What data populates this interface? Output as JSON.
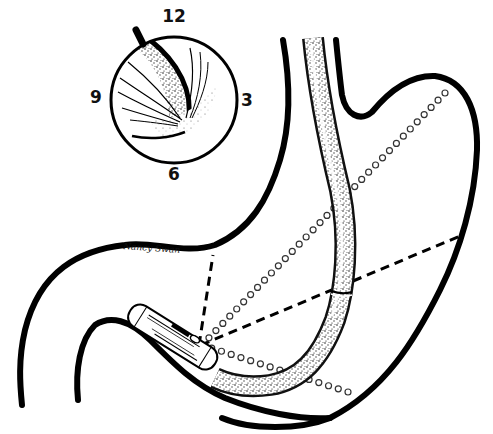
{
  "figure": {
    "inset": {
      "description": "Endoscopic view with clock-face orientation",
      "clock_labels": {
        "top": "12",
        "right": "3",
        "bottom": "6",
        "left": "9"
      }
    },
    "signature": "Nancy Swan",
    "colors": {
      "ink": "#000000",
      "background": "#ffffff"
    }
  }
}
